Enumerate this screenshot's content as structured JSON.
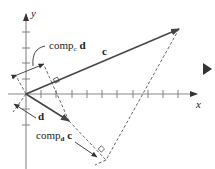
{
  "diagram": {
    "axes": {
      "x_label": "x",
      "y_label": "y"
    },
    "vectors": {
      "c": {
        "label": "c"
      },
      "d": {
        "label": "d"
      }
    },
    "annotations": {
      "comp_c_d": {
        "prefix": "comp",
        "sub": "c",
        "vec": "d"
      },
      "comp_d_c": {
        "prefix": "comp",
        "sub": "d",
        "vec": "c"
      }
    },
    "colors": {
      "axis": "#888888",
      "vector": "#444444",
      "dashed": "#555555",
      "text": "#222222",
      "nav_arrow": "#333333"
    },
    "nav": {
      "next_icon": "triangle-right"
    }
  }
}
